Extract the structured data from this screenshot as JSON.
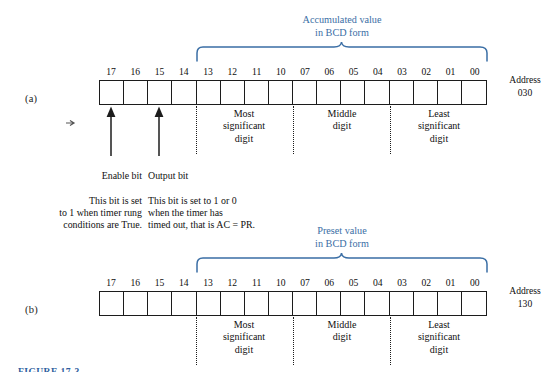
{
  "figure": {
    "caption": "FIGURE 17-3",
    "caption_color": "#2f5f9e"
  },
  "accent": {
    "blue": "#3a6ea5",
    "ink": "#101010"
  },
  "bit_labels": [
    "17",
    "16",
    "15",
    "14",
    "13",
    "12",
    "11",
    "10",
    "07",
    "06",
    "05",
    "04",
    "03",
    "02",
    "01",
    "00"
  ],
  "panel_a": {
    "label": "(a)",
    "address_word": "Address",
    "address_value": "030",
    "brace_line1": "Accumulated value",
    "brace_line2": "in BCD form",
    "digit_groups": [
      {
        "line1": "Most",
        "line2": "significant",
        "line3": "digit"
      },
      {
        "line1": "Middle",
        "line2": "digit",
        "line3": ""
      },
      {
        "line1": "Least",
        "line2": "significant",
        "line3": "digit"
      }
    ],
    "annotations": [
      {
        "title": "Enable bit",
        "body": "This bit is set\nto 1 when timer rung\nconditions are True."
      },
      {
        "title": "Output bit",
        "body": "This bit is set to 1 or 0\nwhen the timer has\ntimed out, that is AC = PR."
      }
    ]
  },
  "panel_b": {
    "label": "(b)",
    "address_word": "Address",
    "address_value": "130",
    "brace_line1": "Preset value",
    "brace_line2": "in BCD form",
    "digit_groups": [
      {
        "line1": "Most",
        "line2": "significant",
        "line3": "digit"
      },
      {
        "line1": "Middle",
        "line2": "digit",
        "line3": ""
      },
      {
        "line1": "Least",
        "line2": "significant",
        "line3": "digit"
      }
    ]
  }
}
